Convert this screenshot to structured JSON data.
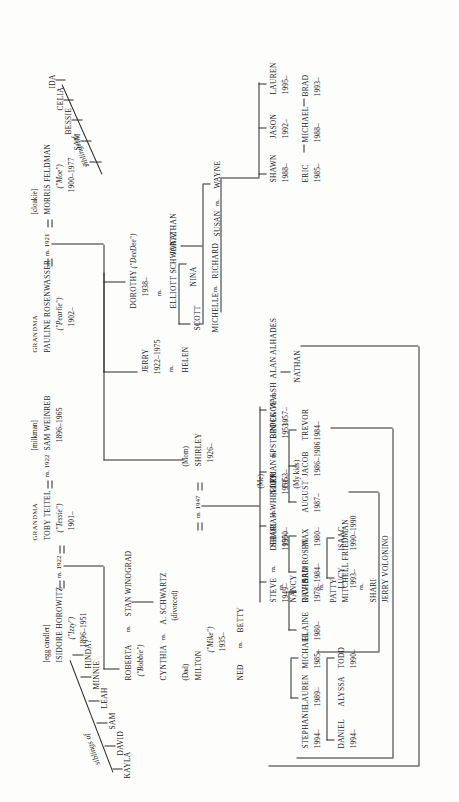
{
  "document": {
    "type": "family-tree-genealogy-chart",
    "orientation": "rotated-90-degrees-counterclockwise",
    "annotations": {
      "me": "(Me)",
      "mom": "(Mom)",
      "dad": "(Dad)",
      "my_kids": "(My kids)",
      "siblings_of": "siblings of",
      "divorced": "(divorced)",
      "marriage_prefix": "m."
    }
  },
  "sibling_groups": [
    {
      "id": "horowitz-siblings",
      "label": "siblings of",
      "of": "ISIDORE HOROWITZ",
      "members": [
        "KAYLA",
        "DAVID",
        "SAM",
        "LEAH",
        "MINNIE",
        "HINDA?"
      ]
    },
    {
      "id": "feldman-siblings",
      "label": "siblings of",
      "of": "MORRIS FELDMAN",
      "members": [
        "IDA",
        "CELIA",
        "BESSIE",
        "SAM",
        "?"
      ]
    }
  ],
  "generation_1": [
    {
      "id": "isidore",
      "title": "",
      "occupation": "[egg candler]",
      "name": "ISIDORE HOROWITZ",
      "nickname": "(\"Izzy\")",
      "years": "1896–1951",
      "marriage": "m. 1922"
    },
    {
      "id": "toby",
      "title": "GRANDMA",
      "occupation": "",
      "name": "TOBY TEITEL",
      "nickname": "(\"Tessie\")",
      "years": "1901–",
      "marriage": "m. 1922"
    },
    {
      "id": "sam-weinreb",
      "title": "",
      "occupation": "[milkman]",
      "name": "SAM WEINREB",
      "nickname": "",
      "years": "1896–1965",
      "marriage": ""
    },
    {
      "id": "pauline",
      "title": "GRANDMA",
      "occupation": "",
      "name": "PAULINE ROSENWASSER",
      "nickname": "(\"Pearlie\")",
      "years": "1902–",
      "marriage": "m. 1921"
    },
    {
      "id": "morris",
      "title": "",
      "occupation": "[cloakie]",
      "name": "MORRIS FELDMAN",
      "nickname": "(\"Moe\")",
      "years": "1900–1977",
      "marriage": "m. 1921"
    }
  ],
  "generation_2": [
    {
      "id": "roberta",
      "name": "ROBERTA",
      "nickname": "(\"Bobbie\")",
      "years": "",
      "spouse": "STAN WINOGRAD",
      "marriage": "m."
    },
    {
      "id": "cynthia",
      "name": "CYNTHIA",
      "nickname": "",
      "years": "",
      "spouse": "A. SCHWARTZ",
      "marriage": "m.",
      "note": "(divorced)"
    },
    {
      "id": "milton",
      "name": "MILTON",
      "nickname": "(\"Mike\")",
      "years": "1935–",
      "role": "(Dad)",
      "marriage": "m. 1947"
    },
    {
      "id": "ned",
      "name": "NED",
      "nickname": "",
      "years": "",
      "spouse": "BETTY",
      "marriage": "m."
    },
    {
      "id": "shirley",
      "name": "SHIRLEY",
      "nickname": "",
      "years": "1926–",
      "role": "(Mom)",
      "marriage": "m. 1947"
    },
    {
      "id": "jerry",
      "name": "JERRY",
      "nickname": "",
      "years": "1922–1975",
      "spouse": "HELEN",
      "marriage": "m."
    },
    {
      "id": "dorothy",
      "name": "DOROTHY",
      "nickname": "(\"DeeDee\")",
      "years": "1938–",
      "spouse": "ELLIOTT SCHWARTZ",
      "marriage": "m."
    }
  ],
  "generation_3": [
    {
      "id": "nancy",
      "name": "NANCY",
      "spouse": "RICHARD ROSEN",
      "marriage": "m."
    },
    {
      "id": "patty",
      "name": "PATTY",
      "spouse": "MITCHELL FRIEDMAN",
      "marriage": "m."
    },
    {
      "id": "shari-w",
      "name": "SHARI",
      "spouse": "JERRY VOLONINO",
      "marriage": "m."
    },
    {
      "id": "steve",
      "name": "STEVE",
      "years": "1949–",
      "spouse": "DEBORAH WHEELER",
      "spouse_years": "1950–",
      "marriage": "m."
    },
    {
      "id": "shari",
      "name": "SHARI",
      "years": "1950–",
      "spouse": "NORMAN EPSTEIN",
      "spouse_years": "1951–",
      "marriage": "m."
    },
    {
      "id": "joy",
      "name": "JOY",
      "years": "1953–",
      "role": "(Me)",
      "spouse": "BROCK WALSH",
      "spouse_years": "1953–",
      "marriage": "m."
    },
    {
      "id": "peggy",
      "name": "PEGGY",
      "years": "1957–",
      "spouse": "ALAN ALHADES",
      "marriage": "m."
    },
    {
      "id": "scott",
      "name": "SCOTT",
      "years": ""
    },
    {
      "id": "nina",
      "name": "NINA",
      "years": ""
    },
    {
      "id": "jonathan",
      "name": "JONATHAN",
      "years": ""
    },
    {
      "id": "michelle",
      "name": "MICHELLE",
      "spouse": "RICHARD",
      "marriage": "m."
    },
    {
      "id": "susan",
      "name": "SUSAN",
      "spouse": "WAYNE",
      "marriage": "m."
    },
    {
      "id": "nathan",
      "name": "NATHAN",
      "years": ""
    }
  ],
  "generation_4": [
    {
      "id": "michael-r",
      "name": "MICHAEL",
      "years": "1985–",
      "parent": "nancy"
    },
    {
      "id": "lauren-r",
      "name": "LAUREN",
      "years": "1989–",
      "parent": "nancy"
    },
    {
      "id": "stephanie",
      "name": "STEPHANIE",
      "years": "1994–",
      "parent": "patty"
    },
    {
      "id": "todd",
      "name": "TODD",
      "years": "1990–",
      "parent": "shari-w"
    },
    {
      "id": "alyssa",
      "name": "ALYSSA",
      "years": "",
      "parent": "shari-w"
    },
    {
      "id": "daniel",
      "name": "DANIEL",
      "years": "1994–",
      "parent": "shari-w"
    },
    {
      "id": "david-w",
      "name": "DAVID",
      "years": "1978–",
      "parent": "steve"
    },
    {
      "id": "elaine",
      "name": "ELAINE",
      "years": "1980–",
      "parent": "steve"
    },
    {
      "id": "max",
      "name": "MAX",
      "years": "1980–",
      "parent": "shari"
    },
    {
      "id": "sam-e",
      "name": "SAM",
      "years": "1984–",
      "parent": "shari"
    },
    {
      "id": "trevor",
      "name": "TREVOR",
      "years": "1984–",
      "parent": "joy"
    },
    {
      "id": "jacob",
      "name": "JACOB",
      "years": "1986–1986",
      "parent": "joy"
    },
    {
      "id": "august",
      "name": "AUGUST",
      "years": "1987–",
      "parent": "joy"
    },
    {
      "id": "isaac",
      "name": "ISAAC",
      "years": "1990–1990",
      "parent": "joy"
    },
    {
      "id": "lucy",
      "name": "LUCY",
      "years": "1993–",
      "parent": "joy"
    },
    {
      "id": "eric",
      "name": "ERIC",
      "years": "1985–",
      "parent": "susan"
    },
    {
      "id": "michael-s",
      "name": "MICHAEL",
      "years": "1988–",
      "parent": "susan"
    },
    {
      "id": "brad",
      "name": "BRAD",
      "years": "1993–",
      "parent": "susan"
    },
    {
      "id": "shawn",
      "name": "SHAWN",
      "years": "1988–",
      "parent": "michelle"
    },
    {
      "id": "jason",
      "name": "JASON",
      "years": "1992–",
      "parent": "michelle"
    },
    {
      "id": "lauren-m",
      "name": "LAUREN",
      "years": "1995–",
      "parent": "michelle"
    }
  ]
}
